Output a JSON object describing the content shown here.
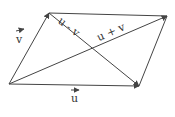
{
  "diagram": {
    "points": {
      "origin": [
        9,
        84
      ],
      "v_tip": [
        49,
        13
      ],
      "u_tip": [
        139,
        86
      ],
      "sum_tip": [
        167,
        16
      ]
    },
    "labels": {
      "v": "v",
      "u": "u",
      "u_minus_v": "u - v",
      "u_plus_v": "u + v"
    },
    "colors": {
      "stroke": "#444444",
      "text": "#333333",
      "background": "#ffffff"
    }
  }
}
